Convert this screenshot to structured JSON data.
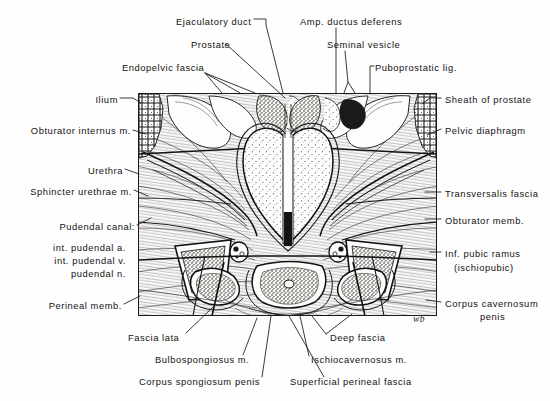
{
  "figure": {
    "type": "anatomical-illustration",
    "signature": "wb",
    "frame": {
      "x": 138,
      "y": 93,
      "width": 299,
      "height": 223
    }
  },
  "labels": {
    "top": [
      {
        "id": "ejaculatory-duct",
        "text": "Ejaculatory  duct",
        "x": 176,
        "y": 22,
        "align": "left"
      },
      {
        "id": "amp-ductus-deferens",
        "text": "Amp. ductus deferens",
        "x": 300,
        "y": 22,
        "align": "left"
      },
      {
        "id": "prostate",
        "text": "Prostate",
        "x": 191,
        "y": 45,
        "align": "left"
      },
      {
        "id": "seminal-vesicle",
        "text": "Seminal  vesicle",
        "x": 327,
        "y": 45,
        "align": "left"
      },
      {
        "id": "endopelvic-fascia",
        "text": "Endopelvic fascia",
        "x": 122,
        "y": 68,
        "align": "left"
      },
      {
        "id": "puboprostatic-lig",
        "text": "Puboprostatic lig.",
        "x": 375,
        "y": 68,
        "align": "left"
      }
    ],
    "left": [
      {
        "id": "ilium",
        "text": "Ilium",
        "x": 88,
        "y": 100
      },
      {
        "id": "obturator-internus-m",
        "text": "Obturator internus m.",
        "x": 17,
        "y": 131
      },
      {
        "id": "urethra",
        "text": "Urethra",
        "x": 90,
        "y": 171
      },
      {
        "id": "sphincter-urethrae-m",
        "text": "Sphincter urethrae m.",
        "x": 26,
        "y": 192
      },
      {
        "id": "pudendal-canal",
        "text": "Pudendal canal:",
        "x": 68,
        "y": 227
      },
      {
        "id": "int-pudendal-a",
        "text": "int. pudendal a.",
        "x": 42,
        "y": 248
      },
      {
        "id": "int-pudendal-v",
        "text": "int. pudendal v.",
        "x": 42,
        "y": 261
      },
      {
        "id": "pudendal-n",
        "text": "pudendal n.",
        "x": 60,
        "y": 274
      },
      {
        "id": "perineal-memb",
        "text": "Perineal memb.",
        "x": 44,
        "y": 306
      }
    ],
    "right": [
      {
        "id": "sheath-of-prostate",
        "text": "Sheath of prostate",
        "x": 443,
        "y": 100
      },
      {
        "id": "pelvic-diaphragm",
        "text": "Pelvic diaphragm",
        "x": 443,
        "y": 131
      },
      {
        "id": "transversalis-fascia",
        "text": "Transversalis fascia",
        "x": 443,
        "y": 194
      },
      {
        "id": "obturator-memb",
        "text": "Obturator memb.",
        "x": 443,
        "y": 221
      },
      {
        "id": "inf-pubic-ramus",
        "text": "Inf. pubic ramus",
        "x": 443,
        "y": 254
      },
      {
        "id": "ischiopubic",
        "text": "(ischiopubic)",
        "x": 452,
        "y": 268
      },
      {
        "id": "corpus-cavernosum",
        "text": "Corpus cavernosum",
        "x": 443,
        "y": 304
      },
      {
        "id": "corpus-cavernosum-2",
        "text": "penis",
        "x": 478,
        "y": 317
      }
    ],
    "bottom": [
      {
        "id": "fascia-lata",
        "text": "Fascia lata",
        "x": 128,
        "y": 338
      },
      {
        "id": "deep-fascia",
        "text": "Deep fascia",
        "x": 330,
        "y": 338
      },
      {
        "id": "bulbospongiosus-m",
        "text": "Bulbospongiosus  m.",
        "x": 155,
        "y": 360
      },
      {
        "id": "ischiocavernosus-m",
        "text": "Ischiocavernosus  m.",
        "x": 311,
        "y": 360
      },
      {
        "id": "corpus-spongiosum-penis",
        "text": "Corpus spongiosum penis",
        "x": 139,
        "y": 382
      },
      {
        "id": "superficial-perineal-fascia",
        "text": "Superficial perineal fascia",
        "x": 290,
        "y": 382
      }
    ]
  },
  "colors": {
    "ink": "#131313",
    "paper": "#fefefe",
    "plate_paper": "#fdfdfb",
    "frame": "#1b1b1b"
  }
}
